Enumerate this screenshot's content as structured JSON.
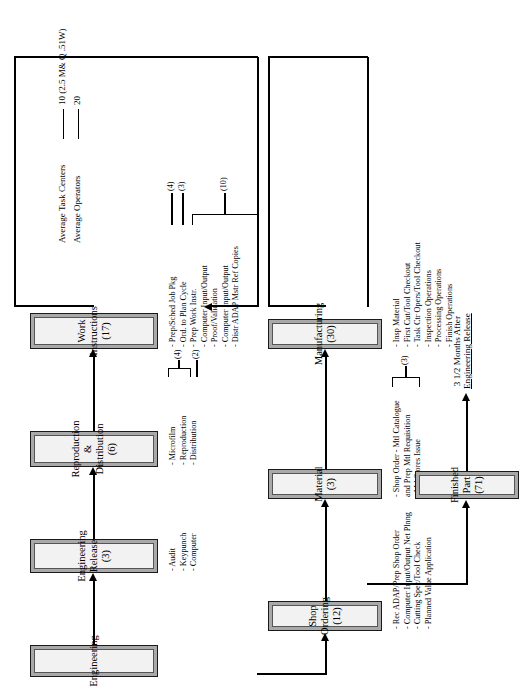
{
  "document": {
    "type": "process-flow-diagram",
    "orientation": "landscape-rotated-90ccw"
  },
  "nodes": [
    {
      "id": "engineering",
      "label": "Engineering",
      "count": ""
    },
    {
      "id": "eng-release",
      "label": "Engineering",
      "label2": "Release (3)"
    },
    {
      "id": "repro-dist",
      "label": "Reproduction &",
      "label2": "Distribution (6)"
    },
    {
      "id": "work-instr",
      "label": "Work",
      "label2": "Instructions (17)"
    },
    {
      "id": "shop-ordering",
      "label": "Shop Ordering (12)",
      "label2": ""
    },
    {
      "id": "material",
      "label": "Material (3)",
      "label2": ""
    },
    {
      "id": "manufacturing",
      "label": "Manufacturing (30)",
      "label2": ""
    },
    {
      "id": "finished-part",
      "label": "Finished Part (71)",
      "label2": ""
    }
  ],
  "eng_release": {
    "bullets": [
      "- Audit",
      "- Keypunch",
      "- Computer"
    ]
  },
  "repro_dist": {
    "bullets": [
      "- Microfilm",
      "- Reproduction",
      "- Distribution"
    ],
    "counts": {
      "group_microfilm_repro": "(4)",
      "distribution": "(2)"
    }
  },
  "work_instructions": {
    "bullets": [
      "- Prep/Sched Job Pkg",
      "- Ord. to Plan Cycle",
      "- Prep Work Instr.",
      "- Computer Input/Output",
      "- Proof/Validation",
      "- Computer Input/Output",
      "- Distr ADAP Mstr Ref Copies"
    ],
    "counts": {
      "prep_sched_job_pkg": "(4)",
      "ord_to_plan_cycle": "(3)",
      "group_remaining": "(10)"
    }
  },
  "shop_ordering": {
    "bullets": [
      "- Rec ADAP/Prep Shop Order",
      "- Computer Input/Output Net Plnng",
      "- Cutting Spec/Tool Check",
      "- Planned Value Application"
    ],
    "counts": [
      "(3)",
      "(1)",
      "(5)",
      "(3)"
    ]
  },
  "material": {
    "bullets": [
      "- Shop Order - Mtl Catalogue",
      "  and Prep Mtl Requisition",
      "- Mtl Stores Issue"
    ],
    "counts": {
      "group": "(3)"
    }
  },
  "manufacturing": {
    "bullets": [
      "- Insp Material",
      "- First Cut/Tool Checkout",
      "- Task Ctr Opers/Tool Checkout",
      "- Inspection Operations",
      "- Processing Operations",
      "- Finish Operations"
    ]
  },
  "statistics": [
    {
      "label": "Average Task Centers",
      "value": "10 (2.5 M& Q .51W)"
    },
    {
      "label": "Average Operators",
      "value": "20"
    }
  ],
  "timing_note": {
    "line1": "3 1/2 Months After",
    "line2": "Engineering Release"
  }
}
